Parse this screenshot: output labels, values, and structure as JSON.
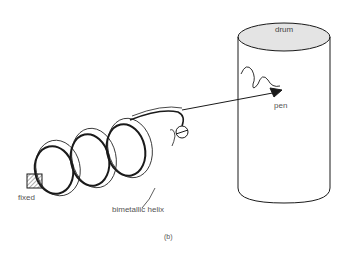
{
  "diagram": {
    "caption": "(b)",
    "labels": {
      "drum": "drum",
      "pen": "pen",
      "fixed": "fixed",
      "helix": "bimetallic helix"
    },
    "colors": {
      "line": "#1a1a1a",
      "drum_top_fill": "#e4e4e4",
      "label_text": "#555555"
    }
  }
}
